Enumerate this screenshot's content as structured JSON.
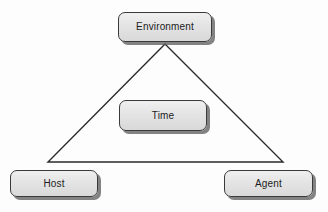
{
  "diagram": {
    "background_color": "#fdfdfd",
    "nodes": {
      "environment": {
        "label": "Environment"
      },
      "time": {
        "label": "Time"
      },
      "host": {
        "label": "Host"
      },
      "agent": {
        "label": "Agent"
      }
    },
    "shape": {
      "name": "triangle",
      "stroke_color": "#2b2b2b",
      "fill": "none",
      "apex": {
        "x": 165,
        "y": 44
      },
      "bottom_left": {
        "x": 48,
        "y": 162
      },
      "bottom_right": {
        "x": 283,
        "y": 162
      }
    },
    "style": {
      "node_fill": "#e4e4e4",
      "node_border": "#3a3a3a",
      "node_shadow": "#5a5a5a",
      "text_color": "#1c1c1c"
    }
  }
}
